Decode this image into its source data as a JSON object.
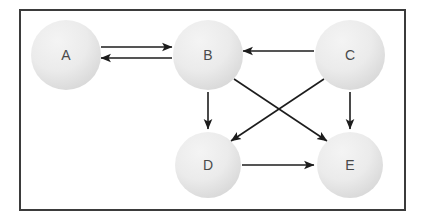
{
  "figure": {
    "kind": "directed-graph-diagram",
    "border_color": "#3b3b3b",
    "background_color": "#ffffff",
    "edge_color": "#1c1c1c",
    "node_fill_light": "#efefef",
    "node_fill_dark": "#d9d9d9",
    "node_label_color": "#4a4a4a"
  },
  "nodes": [
    {
      "id": "A",
      "label": "A",
      "cx": 66,
      "cy": 55,
      "r": 35
    },
    {
      "id": "B",
      "label": "B",
      "cx": 208,
      "cy": 55,
      "r": 35
    },
    {
      "id": "C",
      "label": "C",
      "cx": 350,
      "cy": 55,
      "r": 35
    },
    {
      "id": "D",
      "label": "D",
      "cx": 208,
      "cy": 165,
      "r": 33
    },
    {
      "id": "E",
      "label": "E",
      "cx": 350,
      "cy": 165,
      "r": 33
    }
  ],
  "edges": [
    {
      "id": "a-to-b",
      "from": "A",
      "to": "B",
      "x1": 101,
      "y1": 47,
      "x2": 172,
      "y2": 47,
      "direction": "right"
    },
    {
      "id": "b-to-a",
      "from": "B",
      "to": "A",
      "x1": 172,
      "y1": 58,
      "x2": 101,
      "y2": 58,
      "direction": "left"
    },
    {
      "id": "c-to-b",
      "from": "C",
      "to": "B",
      "x1": 314,
      "y1": 51,
      "x2": 243,
      "y2": 51,
      "direction": "left"
    },
    {
      "id": "b-to-d",
      "from": "B",
      "to": "D",
      "x1": 208,
      "y1": 92,
      "x2": 208,
      "y2": 129,
      "direction": "down"
    },
    {
      "id": "c-to-e",
      "from": "C",
      "to": "E",
      "x1": 350,
      "y1": 92,
      "x2": 350,
      "y2": 129,
      "direction": "down"
    },
    {
      "id": "b-to-e",
      "from": "B",
      "to": "E",
      "x1": 234,
      "y1": 79,
      "x2": 327,
      "y2": 141,
      "direction": "down-right"
    },
    {
      "id": "c-to-d",
      "from": "C",
      "to": "D",
      "x1": 324,
      "y1": 79,
      "x2": 231,
      "y2": 141,
      "direction": "down-left"
    },
    {
      "id": "d-to-e",
      "from": "D",
      "to": "E",
      "x1": 242,
      "y1": 165,
      "x2": 314,
      "y2": 165,
      "direction": "right"
    }
  ]
}
